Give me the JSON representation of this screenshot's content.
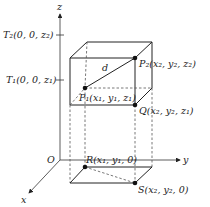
{
  "diagram": {
    "axes": {
      "x": "x",
      "y": "y",
      "z": "z",
      "origin": "O"
    },
    "z_ticks": [
      {
        "label": "T₂(0, 0, z₂)"
      },
      {
        "label": "T₁(0, 0, z₁)"
      }
    ],
    "points": {
      "P1": "P₁(x₁, y₁, z₁)",
      "P2": "P₂(x₂, y₂, z₂)",
      "Q": "Q(x₂, y₂, z₁)",
      "R": "R(x₁, y₁, 0)",
      "S": "S(x₂, y₂, 0)"
    },
    "distance_label": "d",
    "colors": {
      "line": "#222222",
      "background": "#ffffff"
    }
  }
}
